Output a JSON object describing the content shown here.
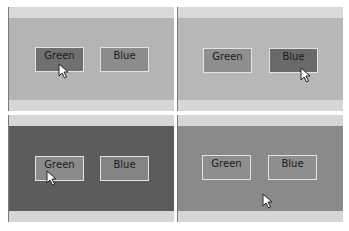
{
  "panels": [
    {
      "id": "top-left",
      "state": "hover-green",
      "colors": {
        "strip": "#d9d9d9",
        "body": "#b4b4b4",
        "green_btn": "#707070",
        "blue_btn": "#8c8c8c"
      },
      "buttons": [
        {
          "label": "Green"
        },
        {
          "label": "Blue"
        }
      ]
    },
    {
      "id": "top-right",
      "state": "hover-blue",
      "colors": {
        "strip": "#d9d9d9",
        "body": "#b7b7b7",
        "green_btn": "#8e8e8e",
        "blue_btn": "#6a6a6a"
      },
      "buttons": [
        {
          "label": "Green"
        },
        {
          "label": "Blue"
        }
      ]
    },
    {
      "id": "bottom-left",
      "state": "green-selected-hover",
      "colors": {
        "strip": "#d6d6d6",
        "body": "#5c5c5c",
        "green_btn": "#8a8a8a",
        "blue_btn": "#848484"
      },
      "buttons": [
        {
          "label": "Green"
        },
        {
          "label": "Blue"
        }
      ]
    },
    {
      "id": "bottom-right",
      "state": "blue-selected",
      "colors": {
        "strip": "#d6d6d6",
        "body": "#8a8a8a",
        "green_btn": "#8e8e8e",
        "blue_btn": "#8e8e8e"
      },
      "buttons": [
        {
          "label": "Green"
        },
        {
          "label": "Blue"
        }
      ]
    }
  ]
}
